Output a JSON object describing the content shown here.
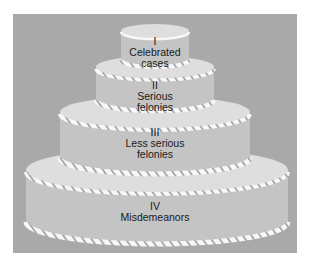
{
  "diagram": {
    "type": "tiered-cake",
    "colors": {
      "background": "#a9a9a9",
      "cake_side": "#c4c4c4",
      "cake_top": "#dcdcdc",
      "frosting": "#f7f7f7",
      "text": "#1a1a1a"
    },
    "tiers": [
      {
        "numeral": "I",
        "line1": "Celebrated",
        "line2": "cases"
      },
      {
        "numeral": "II",
        "line1": "Serious",
        "line2": "felonies"
      },
      {
        "numeral": "III",
        "line1": "Less serious",
        "line2": "felonies"
      },
      {
        "numeral": "IV",
        "line1": "Misdemeanors",
        "line2": ""
      }
    ]
  }
}
